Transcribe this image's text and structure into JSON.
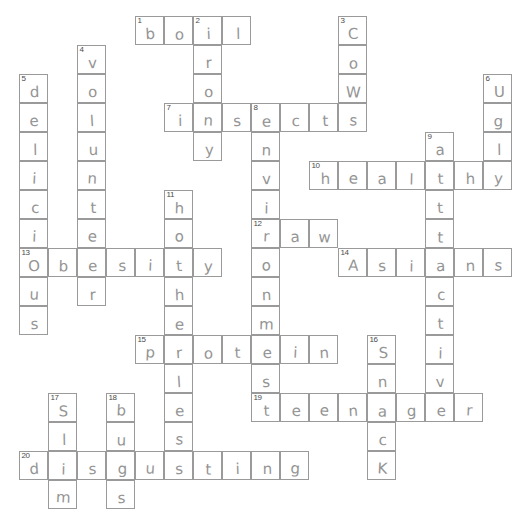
{
  "puzzle": {
    "title": "Health and Lifestyle Crossword",
    "grid": {
      "cell_size": 29,
      "origin_x": 19,
      "origin_y": 16,
      "columns": 17,
      "rows": 17
    },
    "footer_note": "",
    "colors": {
      "grid_line": "#9a9a9a",
      "pencil_ink": "#8c8c8c",
      "number_ink": "#4a4a4a",
      "background": "#ffffff"
    },
    "entries": [
      {
        "number": 1,
        "direction": "across",
        "answer": "boil",
        "row": 0,
        "col": 4
      },
      {
        "number": 2,
        "direction": "down",
        "answer": "iron",
        "row": 0,
        "col": 6
      },
      {
        "number": 3,
        "direction": "down",
        "answer": "cows",
        "row": 0,
        "col": 11
      },
      {
        "number": 4,
        "direction": "down",
        "answer": "volunteer",
        "row": 1,
        "col": 2
      },
      {
        "number": 5,
        "direction": "down",
        "answer": "delicious",
        "row": 2,
        "col": 0
      },
      {
        "number": 6,
        "direction": "down",
        "answer": "ugly",
        "row": 3,
        "col": 16
      },
      {
        "number": 7,
        "direction": "across",
        "answer": "insects",
        "row": 3,
        "col": 5
      },
      {
        "number": 8,
        "direction": "down",
        "answer": "environment",
        "row": 3,
        "col": 8
      },
      {
        "number": 9,
        "direction": "down",
        "answer": "attractive",
        "row": 4,
        "col": 14
      },
      {
        "number": 10,
        "direction": "across",
        "answer": "healthy",
        "row": 5,
        "col": 10
      },
      {
        "number": 11,
        "direction": "down",
        "answer": "hotheroles",
        "row": 6,
        "col": 5
      },
      {
        "number": 12,
        "direction": "across",
        "answer": "raw",
        "row": 7,
        "col": 8
      },
      {
        "number": 13,
        "direction": "across",
        "answer": "obesity",
        "row": 8,
        "col": 0
      },
      {
        "number": 14,
        "direction": "across",
        "answer": "Asians",
        "row": 8,
        "col": 11
      },
      {
        "number": 15,
        "direction": "across",
        "answer": "protein",
        "row": 11,
        "col": 4
      },
      {
        "number": 16,
        "direction": "down",
        "answer": "snack",
        "row": 11,
        "col": 12
      },
      {
        "number": 17,
        "direction": "down",
        "answer": "slim",
        "row": 13,
        "col": 1
      },
      {
        "number": 18,
        "direction": "down",
        "answer": "bus",
        "row": 13,
        "col": 3
      },
      {
        "number": 19,
        "direction": "across",
        "answer": "teenager",
        "row": 13,
        "col": 8
      },
      {
        "number": 20,
        "direction": "across",
        "answer": "disgusting",
        "row": 15,
        "col": 0
      }
    ],
    "cells": [
      {
        "col": 4,
        "row": 0,
        "letter": "b",
        "number": "1"
      },
      {
        "col": 5,
        "row": 0,
        "letter": "o",
        "number": ""
      },
      {
        "col": 6,
        "row": 0,
        "letter": "i",
        "number": "2"
      },
      {
        "col": 7,
        "row": 0,
        "letter": "l",
        "number": ""
      },
      {
        "col": 11,
        "row": 0,
        "letter": "C",
        "number": "3"
      },
      {
        "col": 6,
        "row": 1,
        "letter": "r",
        "number": ""
      },
      {
        "col": 11,
        "row": 1,
        "letter": "o",
        "number": ""
      },
      {
        "col": 2,
        "row": 1,
        "letter": "v",
        "number": "4"
      },
      {
        "col": 6,
        "row": 2,
        "letter": "o",
        "number": ""
      },
      {
        "col": 11,
        "row": 2,
        "letter": "W",
        "number": ""
      },
      {
        "col": 2,
        "row": 2,
        "letter": "o",
        "number": ""
      },
      {
        "col": 0,
        "row": 2,
        "letter": "d",
        "number": "5"
      },
      {
        "col": 16,
        "row": 2,
        "letter": "U",
        "number": "6"
      },
      {
        "col": 5,
        "row": 3,
        "letter": "i",
        "number": "7"
      },
      {
        "col": 6,
        "row": 3,
        "letter": "n",
        "number": ""
      },
      {
        "col": 7,
        "row": 3,
        "letter": "s",
        "number": ""
      },
      {
        "col": 8,
        "row": 3,
        "letter": "e",
        "number": "8"
      },
      {
        "col": 9,
        "row": 3,
        "letter": "c",
        "number": ""
      },
      {
        "col": 10,
        "row": 3,
        "letter": "t",
        "number": ""
      },
      {
        "col": 11,
        "row": 3,
        "letter": "s",
        "number": ""
      },
      {
        "col": 2,
        "row": 3,
        "letter": "l",
        "number": ""
      },
      {
        "col": 0,
        "row": 3,
        "letter": "e",
        "number": ""
      },
      {
        "col": 16,
        "row": 3,
        "letter": "g",
        "number": ""
      },
      {
        "col": 6,
        "row": 4,
        "letter": "y",
        "number": ""
      },
      {
        "col": 8,
        "row": 4,
        "letter": "n",
        "number": ""
      },
      {
        "col": 2,
        "row": 4,
        "letter": "u",
        "number": ""
      },
      {
        "col": 0,
        "row": 4,
        "letter": "l",
        "number": ""
      },
      {
        "col": 14,
        "row": 4,
        "letter": "a",
        "number": "9"
      },
      {
        "col": 16,
        "row": 4,
        "letter": "l",
        "number": ""
      },
      {
        "col": 10,
        "row": 5,
        "letter": "h",
        "number": "10"
      },
      {
        "col": 11,
        "row": 5,
        "letter": "e",
        "number": ""
      },
      {
        "col": 12,
        "row": 5,
        "letter": "a",
        "number": ""
      },
      {
        "col": 13,
        "row": 5,
        "letter": "l",
        "number": ""
      },
      {
        "col": 14,
        "row": 5,
        "letter": "t",
        "number": ""
      },
      {
        "col": 15,
        "row": 5,
        "letter": "h",
        "number": ""
      },
      {
        "col": 16,
        "row": 5,
        "letter": "y",
        "number": ""
      },
      {
        "col": 8,
        "row": 5,
        "letter": "v",
        "number": ""
      },
      {
        "col": 2,
        "row": 5,
        "letter": "n",
        "number": ""
      },
      {
        "col": 0,
        "row": 5,
        "letter": "i",
        "number": ""
      },
      {
        "col": 5,
        "row": 6,
        "letter": "h",
        "number": "11"
      },
      {
        "col": 8,
        "row": 6,
        "letter": "i",
        "number": ""
      },
      {
        "col": 2,
        "row": 6,
        "letter": "t",
        "number": ""
      },
      {
        "col": 0,
        "row": 6,
        "letter": "c",
        "number": ""
      },
      {
        "col": 14,
        "row": 6,
        "letter": "t",
        "number": ""
      },
      {
        "col": 5,
        "row": 7,
        "letter": "o",
        "number": ""
      },
      {
        "col": 8,
        "row": 7,
        "letter": "r",
        "number": "12"
      },
      {
        "col": 9,
        "row": 7,
        "letter": "a",
        "number": ""
      },
      {
        "col": 10,
        "row": 7,
        "letter": "w",
        "number": ""
      },
      {
        "col": 2,
        "row": 7,
        "letter": "e",
        "number": ""
      },
      {
        "col": 0,
        "row": 7,
        "letter": "i",
        "number": ""
      },
      {
        "col": 14,
        "row": 7,
        "letter": "t",
        "number": ""
      },
      {
        "col": 0,
        "row": 8,
        "letter": "O",
        "number": "13"
      },
      {
        "col": 1,
        "row": 8,
        "letter": "b",
        "number": ""
      },
      {
        "col": 2,
        "row": 8,
        "letter": "e",
        "number": ""
      },
      {
        "col": 3,
        "row": 8,
        "letter": "s",
        "number": ""
      },
      {
        "col": 4,
        "row": 8,
        "letter": "i",
        "number": ""
      },
      {
        "col": 5,
        "row": 8,
        "letter": "t",
        "number": ""
      },
      {
        "col": 6,
        "row": 8,
        "letter": "y",
        "number": ""
      },
      {
        "col": 8,
        "row": 8,
        "letter": "o",
        "number": ""
      },
      {
        "col": 11,
        "row": 8,
        "letter": "A",
        "number": "14"
      },
      {
        "col": 12,
        "row": 8,
        "letter": "s",
        "number": ""
      },
      {
        "col": 13,
        "row": 8,
        "letter": "i",
        "number": ""
      },
      {
        "col": 14,
        "row": 8,
        "letter": "a",
        "number": ""
      },
      {
        "col": 15,
        "row": 8,
        "letter": "n",
        "number": ""
      },
      {
        "col": 16,
        "row": 8,
        "letter": "s",
        "number": ""
      },
      {
        "col": 0,
        "row": 9,
        "letter": "u",
        "number": ""
      },
      {
        "col": 2,
        "row": 9,
        "letter": "r",
        "number": ""
      },
      {
        "col": 5,
        "row": 9,
        "letter": "h",
        "number": ""
      },
      {
        "col": 8,
        "row": 9,
        "letter": "n",
        "number": ""
      },
      {
        "col": 14,
        "row": 9,
        "letter": "c",
        "number": ""
      },
      {
        "col": 0,
        "row": 10,
        "letter": "s",
        "number": ""
      },
      {
        "col": 5,
        "row": 10,
        "letter": "e",
        "number": ""
      },
      {
        "col": 8,
        "row": 10,
        "letter": "m",
        "number": ""
      },
      {
        "col": 14,
        "row": 10,
        "letter": "t",
        "number": ""
      },
      {
        "col": 4,
        "row": 11,
        "letter": "p",
        "number": "15"
      },
      {
        "col": 5,
        "row": 11,
        "letter": "r",
        "number": ""
      },
      {
        "col": 6,
        "row": 11,
        "letter": "o",
        "number": ""
      },
      {
        "col": 7,
        "row": 11,
        "letter": "t",
        "number": ""
      },
      {
        "col": 8,
        "row": 11,
        "letter": "e",
        "number": ""
      },
      {
        "col": 9,
        "row": 11,
        "letter": "i",
        "number": ""
      },
      {
        "col": 10,
        "row": 11,
        "letter": "n",
        "number": ""
      },
      {
        "col": 12,
        "row": 11,
        "letter": "S",
        "number": "16"
      },
      {
        "col": 14,
        "row": 11,
        "letter": "i",
        "number": ""
      },
      {
        "col": 5,
        "row": 12,
        "letter": "l",
        "number": ""
      },
      {
        "col": 8,
        "row": 12,
        "letter": "s",
        "number": ""
      },
      {
        "col": 12,
        "row": 12,
        "letter": "n",
        "number": ""
      },
      {
        "col": 14,
        "row": 12,
        "letter": "v",
        "number": ""
      },
      {
        "col": 1,
        "row": 13,
        "letter": "S",
        "number": "17"
      },
      {
        "col": 3,
        "row": 13,
        "letter": "b",
        "number": "18"
      },
      {
        "col": 5,
        "row": 13,
        "letter": "e",
        "number": ""
      },
      {
        "col": 8,
        "row": 13,
        "letter": "t",
        "number": "19"
      },
      {
        "col": 9,
        "row": 13,
        "letter": "e",
        "number": ""
      },
      {
        "col": 10,
        "row": 13,
        "letter": "e",
        "number": ""
      },
      {
        "col": 11,
        "row": 13,
        "letter": "n",
        "number": ""
      },
      {
        "col": 12,
        "row": 13,
        "letter": "a",
        "number": ""
      },
      {
        "col": 13,
        "row": 13,
        "letter": "g",
        "number": ""
      },
      {
        "col": 14,
        "row": 13,
        "letter": "e",
        "number": ""
      },
      {
        "col": 15,
        "row": 13,
        "letter": "r",
        "number": ""
      },
      {
        "col": 1,
        "row": 14,
        "letter": "l",
        "number": ""
      },
      {
        "col": 3,
        "row": 14,
        "letter": "u",
        "number": ""
      },
      {
        "col": 5,
        "row": 14,
        "letter": "s",
        "number": ""
      },
      {
        "col": 12,
        "row": 14,
        "letter": "c",
        "number": ""
      },
      {
        "col": 0,
        "row": 15,
        "letter": "d",
        "number": "20"
      },
      {
        "col": 1,
        "row": 15,
        "letter": "i",
        "number": ""
      },
      {
        "col": 2,
        "row": 15,
        "letter": "s",
        "number": ""
      },
      {
        "col": 3,
        "row": 15,
        "letter": "g",
        "number": ""
      },
      {
        "col": 4,
        "row": 15,
        "letter": "u",
        "number": ""
      },
      {
        "col": 5,
        "row": 15,
        "letter": "s",
        "number": ""
      },
      {
        "col": 6,
        "row": 15,
        "letter": "t",
        "number": ""
      },
      {
        "col": 7,
        "row": 15,
        "letter": "i",
        "number": ""
      },
      {
        "col": 8,
        "row": 15,
        "letter": "n",
        "number": ""
      },
      {
        "col": 9,
        "row": 15,
        "letter": "g",
        "number": ""
      },
      {
        "col": 12,
        "row": 15,
        "letter": "K",
        "number": ""
      },
      {
        "col": 1,
        "row": 16,
        "letter": "m",
        "number": ""
      },
      {
        "col": 3,
        "row": 16,
        "letter": "s",
        "number": ""
      }
    ]
  }
}
